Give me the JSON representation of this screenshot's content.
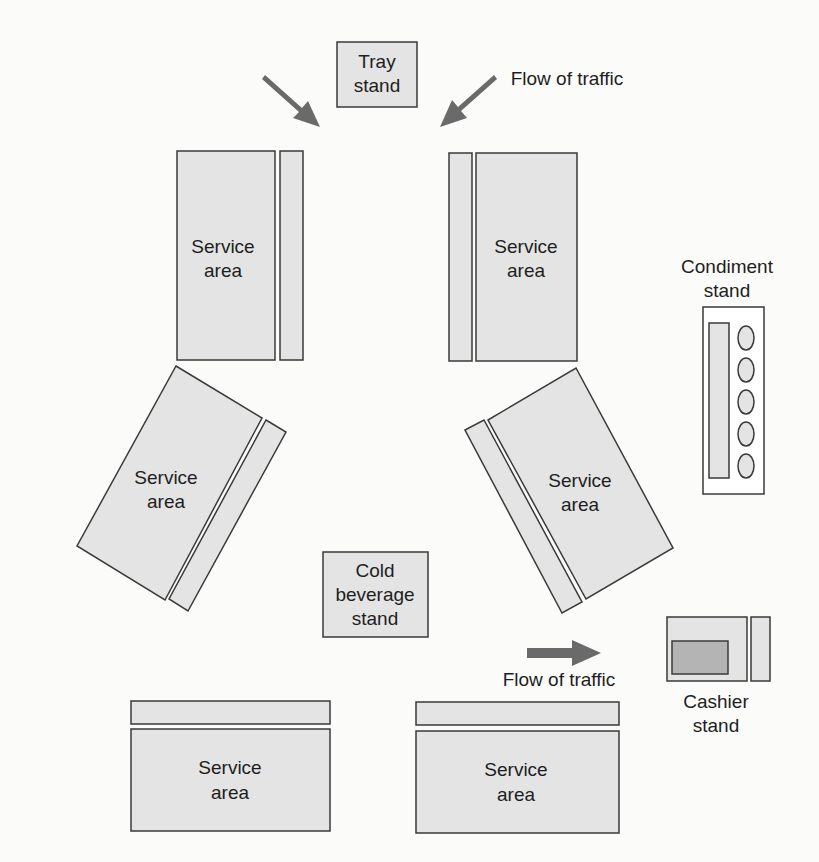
{
  "diagram": {
    "labels": {
      "tray_stand": [
        "Tray",
        "stand"
      ],
      "flow_top": "Flow of traffic",
      "flow_bottom": "Flow of traffic",
      "service_area": [
        "Service",
        "area"
      ],
      "condiment_stand": [
        "Condiment",
        "stand"
      ],
      "cold_beverage": [
        "Cold",
        "beverage",
        "stand"
      ],
      "cashier_stand": [
        "Cashier",
        "stand"
      ]
    },
    "condiment_containers": 5,
    "colors": {
      "fill": "#e4e4e4",
      "register": "#b4b4b4",
      "arrow": "#6a6a6a",
      "stroke": "#3a3a3a"
    }
  }
}
